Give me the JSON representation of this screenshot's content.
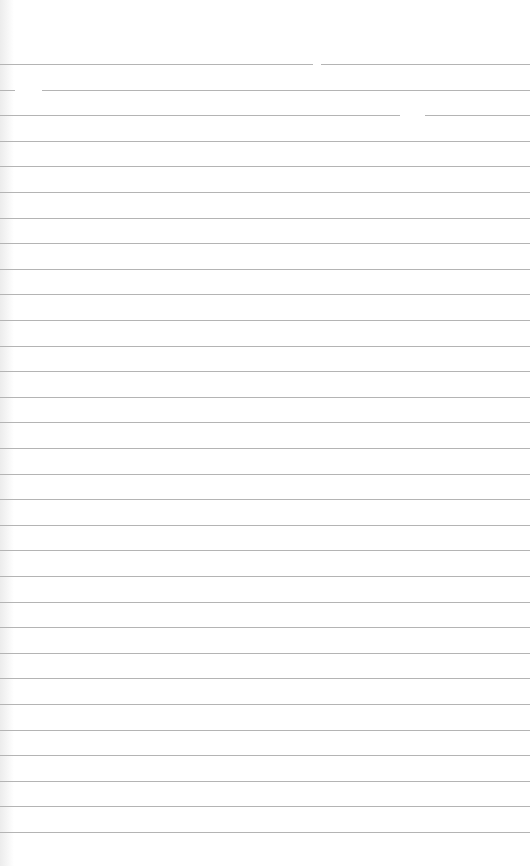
{
  "page": {
    "type": "lined-paper",
    "background_color": "#ffffff",
    "rule_color": "#b4b4b4",
    "rule_count": 31,
    "first_rule_y": 64,
    "rule_spacing": 25.6,
    "gaps": [
      {
        "rule": 0,
        "x": 313,
        "w": 8
      },
      {
        "rule": 1,
        "x": 15,
        "w": 27
      },
      {
        "rule": 2,
        "x": 400,
        "w": 25
      }
    ]
  }
}
